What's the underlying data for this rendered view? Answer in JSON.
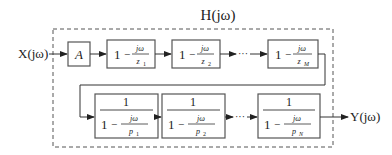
{
  "title": "H(jω)",
  "input_label": "X(jω)",
  "output_label": "Y(jω)",
  "ellipsis": "···",
  "row1": {
    "gain": {
      "label": "A"
    },
    "zeros": [
      {
        "one": "1",
        "minus": "−",
        "num": "jω",
        "den": "z",
        "sub": "1"
      },
      {
        "one": "1",
        "minus": "−",
        "num": "jω",
        "den": "z",
        "sub": "2"
      },
      {
        "one": "1",
        "minus": "−",
        "num": "jω",
        "den": "z",
        "sub": "M"
      }
    ]
  },
  "row2": {
    "poles": [
      {
        "top": "1",
        "one": "1",
        "minus": "−",
        "num": "jω",
        "den": "p",
        "sub": "1"
      },
      {
        "top": "1",
        "one": "1",
        "minus": "−",
        "num": "jω",
        "den": "p",
        "sub": "2"
      },
      {
        "top": "1",
        "one": "1",
        "minus": "−",
        "num": "jω",
        "den": "p",
        "sub": "N"
      }
    ]
  }
}
